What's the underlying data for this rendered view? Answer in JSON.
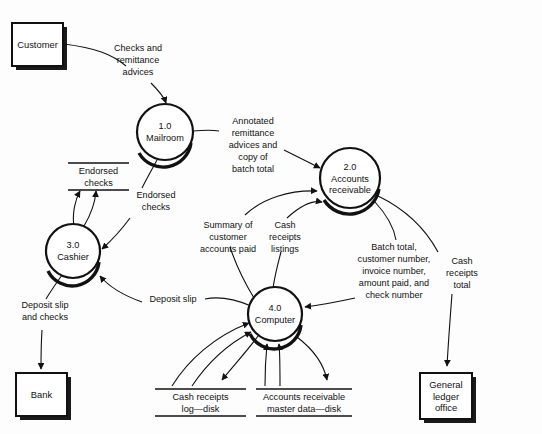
{
  "diagram": {
    "type": "data-flow-diagram",
    "background_color": "#fdfdfd",
    "line_color": "#111111",
    "entities": [
      {
        "id": "customer",
        "label": "Customer",
        "kind": "external-entity"
      },
      {
        "id": "bank",
        "label": "Bank",
        "kind": "external-entity"
      },
      {
        "id": "general-ledger-office",
        "label_line1": "General",
        "label_line2": "ledger",
        "label_line3": "office",
        "kind": "external-entity"
      }
    ],
    "processes": [
      {
        "id": "mailroom",
        "number": "1.0",
        "name": "Mailroom"
      },
      {
        "id": "accounts-receivable",
        "number": "2.0",
        "name_line1": "Accounts",
        "name_line2": "receivable"
      },
      {
        "id": "cashier",
        "number": "3.0",
        "name": "Cashier"
      },
      {
        "id": "computer",
        "number": "4.0",
        "name": "Computer"
      }
    ],
    "data_stores": [
      {
        "id": "endorsed-checks-store",
        "line1": "Endorsed",
        "line2": "checks"
      },
      {
        "id": "cash-receipts-log-store",
        "line1": "Cash receipts",
        "line2": "log—disk"
      },
      {
        "id": "accounts-receivable-master-store",
        "line1": "Accounts receivable",
        "line2": "master data—disk"
      }
    ],
    "flows": [
      {
        "id": "checks-and-remittance-advices",
        "line1": "Checks and",
        "line2": "remittance",
        "line3": "advices",
        "from": "customer",
        "to": "mailroom"
      },
      {
        "id": "annotated-remittance-advices",
        "line1": "Annotated",
        "line2": "remittance",
        "line3": "advices and",
        "line4": "copy of",
        "line5": "batch total",
        "from": "mailroom",
        "to": "accounts-receivable"
      },
      {
        "id": "endorsed-checks-flow",
        "line1": "Endorsed",
        "line2": "checks",
        "from": "mailroom",
        "to": "cashier"
      },
      {
        "id": "summary-of-customer-accounts-paid",
        "line1": "Summary of",
        "line2": "customer",
        "line3": "accounts paid",
        "from": "computer",
        "to": "accounts-receivable"
      },
      {
        "id": "cash-receipts-listings",
        "line1": "Cash",
        "line2": "receipts",
        "line3": "listings",
        "from": "computer",
        "to": "accounts-receivable"
      },
      {
        "id": "batch-total-details",
        "line1": "Batch total,",
        "line2": "customer number,",
        "line3": "invoice number,",
        "line4": "amount paid, and",
        "line5": "check number",
        "from": "accounts-receivable",
        "to": "computer"
      },
      {
        "id": "cash-receipts-total",
        "line1": "Cash",
        "line2": "receipts",
        "line3": "total",
        "from": "computer",
        "to": "general-ledger-office"
      },
      {
        "id": "deposit-slip",
        "label": "Deposit slip",
        "from": "computer",
        "to": "cashier"
      },
      {
        "id": "deposit-slip-and-checks",
        "line1": "Deposit slip",
        "line2": "and checks",
        "from": "cashier",
        "to": "bank"
      }
    ]
  }
}
